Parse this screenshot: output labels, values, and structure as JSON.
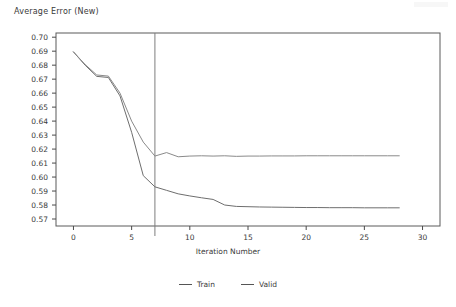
{
  "chart_data": {
    "type": "line",
    "title": "Average Error (New)",
    "xlabel": "Iteration Number",
    "ylabel": "",
    "xlim": [
      -1.5,
      31.5
    ],
    "ylim": [
      0.565,
      0.703
    ],
    "grid": false,
    "legend_position": "bottom-center",
    "x_ticks": [
      0,
      5,
      10,
      15,
      20,
      25,
      30
    ],
    "x_tick_labels": [
      "0",
      "5",
      "10",
      "15",
      "20",
      "25",
      "30"
    ],
    "y_ticks": [
      0.57,
      0.58,
      0.59,
      0.6,
      0.61,
      0.62,
      0.63,
      0.64,
      0.65,
      0.66,
      0.67,
      0.68,
      0.69,
      0.7
    ],
    "y_tick_labels": [
      "0.57",
      "0.58",
      "0.59",
      "0.60",
      "0.61",
      "0.62",
      "0.63",
      "0.64",
      "0.65",
      "0.66",
      "0.67",
      "0.68",
      "0.69",
      "0.70"
    ],
    "annotations": [
      {
        "type": "vertical-line",
        "x": 7,
        "label": "selected-iteration"
      }
    ],
    "x": [
      0,
      1,
      2,
      3,
      4,
      5,
      6,
      7,
      8,
      9,
      10,
      11,
      12,
      13,
      14,
      15,
      16,
      17,
      18,
      19,
      20,
      21,
      22,
      23,
      24,
      25,
      26,
      27,
      28
    ],
    "series": [
      {
        "name": "Train",
        "color": "#6e6e6e",
        "values": [
          0.6895,
          0.68,
          0.672,
          0.6712,
          0.658,
          0.632,
          0.601,
          0.593,
          0.5905,
          0.588,
          0.5865,
          0.5852,
          0.584,
          0.58,
          0.579,
          0.5788,
          0.5786,
          0.5785,
          0.5784,
          0.5783,
          0.5782,
          0.5782,
          0.5781,
          0.5781,
          0.5781,
          0.578,
          0.578,
          0.578,
          0.578
        ]
      },
      {
        "name": "Valid",
        "color": "#8a8a8a",
        "values": [
          0.6895,
          0.6805,
          0.673,
          0.6722,
          0.66,
          0.64,
          0.625,
          0.615,
          0.6175,
          0.6145,
          0.615,
          0.6152,
          0.615,
          0.6152,
          0.6148,
          0.615,
          0.615,
          0.6151,
          0.6151,
          0.6151,
          0.6152,
          0.6152,
          0.6152,
          0.6152,
          0.6152,
          0.6152,
          0.6152,
          0.6152,
          0.6152
        ]
      }
    ]
  },
  "legend": {
    "entries": [
      {
        "label": "Train"
      },
      {
        "label": "Valid"
      }
    ]
  }
}
